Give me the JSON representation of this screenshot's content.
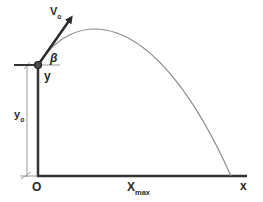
{
  "diagram": {
    "labels": {
      "velocity": "V",
      "velocity_sub": "o",
      "angle": "β",
      "launch_height_marker": "y",
      "initial_height": "y",
      "initial_height_sub": "o",
      "origin": "O",
      "range": "X",
      "range_sub": "max",
      "x_axis": "x"
    },
    "colors": {
      "axes": "#333333",
      "trajectory": "#8a8a8a",
      "dimension_line": "#9a9a9a",
      "text": "#2a2a2a",
      "background": "#ffffff"
    }
  }
}
